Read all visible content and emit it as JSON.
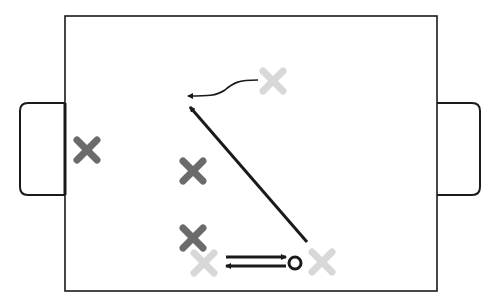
{
  "diagram": {
    "type": "sports-play-diagram",
    "colors": {
      "line": "#1a1a1a",
      "player_dark": "#6b6b6b",
      "player_light": "#d8d8d8",
      "background": "#ffffff"
    },
    "field": {
      "x": 65,
      "y": 16,
      "width": 372,
      "height": 275
    },
    "goals": [
      {
        "side": "left",
        "x": 20,
        "y": 103,
        "width": 45,
        "height": 92
      },
      {
        "side": "right",
        "x": 437,
        "y": 103,
        "width": 43,
        "height": 92
      }
    ],
    "players": [
      {
        "team": "dark",
        "x": 87,
        "y": 150
      },
      {
        "team": "dark",
        "x": 193,
        "y": 171
      },
      {
        "team": "dark",
        "x": 193,
        "y": 238
      },
      {
        "team": "light",
        "x": 273,
        "y": 81
      },
      {
        "team": "light",
        "x": 204,
        "y": 263
      },
      {
        "team": "light",
        "x": 322,
        "y": 262
      }
    ],
    "ball": {
      "x": 295,
      "y": 263,
      "r": 6
    },
    "movements": [
      {
        "kind": "run-curved",
        "from": [
          258,
          80
        ],
        "to": [
          188,
          96
        ]
      },
      {
        "kind": "run-straight",
        "from": [
          307,
          242
        ],
        "to": [
          190,
          107
        ]
      },
      {
        "kind": "pass-right",
        "from": [
          226,
          257
        ],
        "to": [
          286,
          257
        ]
      },
      {
        "kind": "pass-left",
        "from": [
          286,
          266
        ],
        "to": [
          226,
          266
        ]
      }
    ]
  }
}
